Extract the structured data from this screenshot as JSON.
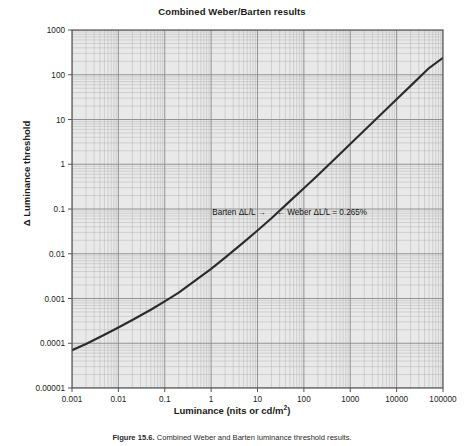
{
  "figure": {
    "title": "Combined Weber/Barten results",
    "caption_prefix": "Figure 15.6.",
    "caption_rest": " Combined Weber and Barten luminance threshold results.",
    "caption_full": "Figure 15.6. Combined Weber and Barten luminance threshold results."
  },
  "axes": {
    "x": {
      "label_main": "Luminance (nits or cd/m",
      "label_sup": "2",
      "label_tail": ")",
      "label_plain": "Luminance (nits or cd/m2)",
      "ticks": [
        "0.001",
        "0.01",
        "0.1",
        "1",
        "10",
        "100",
        "1000",
        "10000",
        "100000"
      ],
      "min": 0.001,
      "max": 100000,
      "scale": "log"
    },
    "y": {
      "label": "Δ Luminance threshold",
      "ticks": [
        "1000",
        "100",
        "10",
        "1",
        "0.1",
        "0.01",
        "0.001",
        "0.0001",
        "0.00001"
      ],
      "min": 1e-05,
      "max": 1000,
      "scale": "log"
    }
  },
  "annotations": [
    {
      "name": "barten-annotation",
      "text": "Barten ΔL/L →"
    },
    {
      "name": "weber-annotation",
      "text": "← Weber ΔL/L = 0.265%"
    }
  ],
  "colors": {
    "plot_background": "#e9e9e9",
    "minor_grid": "#b4b4b4",
    "major_grid": "#8d8d8d",
    "frame": "#555555",
    "curve": "#2b2b2b",
    "text": "#1a1a1a"
  },
  "chart_data": {
    "type": "line",
    "title": "Combined Weber/Barten results",
    "xlabel": "Luminance (nits or cd/m2)",
    "ylabel": "Δ Luminance threshold",
    "xscale": "log",
    "yscale": "log",
    "xlim": [
      0.001,
      100000
    ],
    "ylim": [
      1e-05,
      1000
    ],
    "grid": true,
    "legend": "none",
    "series": [
      {
        "name": "Combined Weber/Barten threshold",
        "x": [
          0.001,
          0.002,
          0.005,
          0.01,
          0.02,
          0.05,
          0.1,
          0.2,
          0.5,
          1,
          2,
          5,
          10,
          20,
          50,
          100,
          200,
          500,
          1000,
          2000,
          5000,
          10000,
          20000,
          50000,
          100000
        ],
        "y": [
          7e-05,
          9.6e-05,
          0.000155,
          0.000225,
          0.00033,
          0.00056,
          0.00086,
          0.00135,
          0.0027,
          0.0046,
          0.0082,
          0.018,
          0.033,
          0.062,
          0.15,
          0.29,
          0.57,
          1.42,
          2.83,
          5.65,
          14.1,
          28.2,
          56.4,
          141.0,
          240.0
        ]
      }
    ],
    "annotations": [
      {
        "text": "Barten ΔL/L →",
        "x": 12,
        "y": 0.09,
        "note": "labels the low-luminance Barten portion of the curve"
      },
      {
        "text": "← Weber ΔL/L = 0.265%",
        "x": 60,
        "y": 0.09,
        "note": "labels the high-luminance Weber portion, slope 1, constant contrast 0.265%"
      }
    ]
  }
}
